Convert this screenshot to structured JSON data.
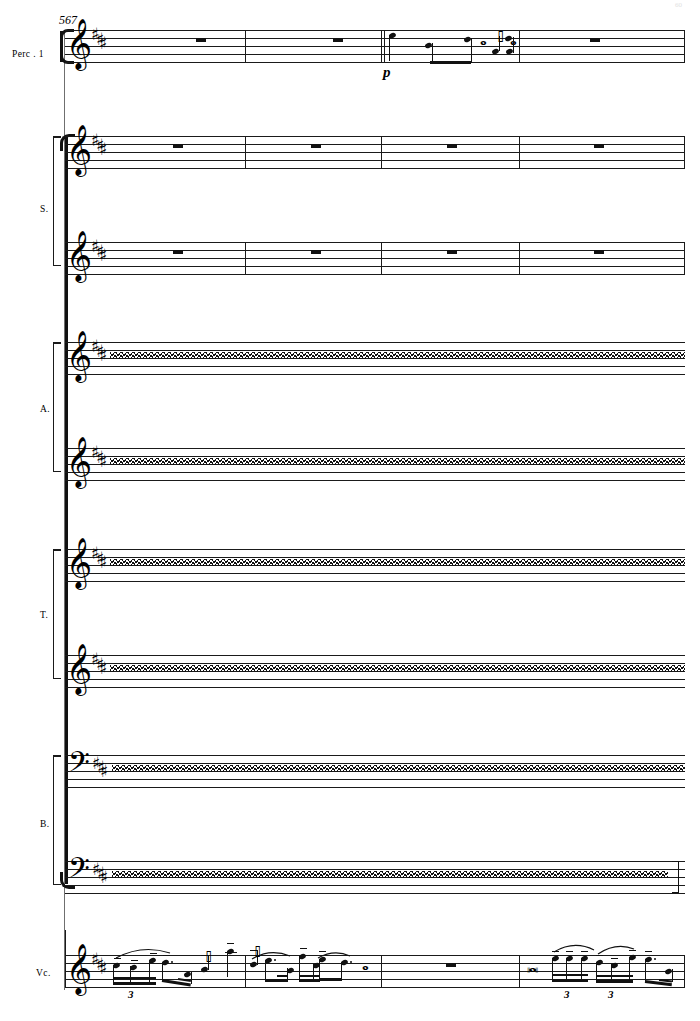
{
  "score": {
    "measure_number": "567",
    "page_number": "60",
    "key_signature": "3 sharps",
    "sharps_count": 3
  },
  "instruments": [
    {
      "id": "perc1",
      "label": "Perc . 1",
      "clef": "treble",
      "staves": 1
    },
    {
      "id": "sop",
      "label": "S.",
      "clef": "treble",
      "staves": 2
    },
    {
      "id": "alto",
      "label": "A.",
      "clef": "treble",
      "staves": 2
    },
    {
      "id": "ten",
      "label": "T.",
      "clef": "treble-8",
      "staves": 2
    },
    {
      "id": "bass",
      "label": "B.",
      "clef": "bass",
      "staves": 2
    },
    {
      "id": "vc",
      "label": "Vc.",
      "clef": "treble",
      "staves": 1
    }
  ],
  "staff_systems": [
    {
      "name": "perc1-staff-1",
      "instrument": "Perc . 1",
      "clef": "treble",
      "content": "rests-and-notes"
    },
    {
      "name": "soprano-staff-1",
      "instrument": "S.",
      "clef": "treble",
      "content": "whole-rests"
    },
    {
      "name": "soprano-staff-2",
      "instrument": "S.",
      "clef": "treble",
      "content": "whole-rests"
    },
    {
      "name": "alto-staff-1",
      "instrument": "A.",
      "clef": "treble",
      "content": "wavy-line"
    },
    {
      "name": "alto-staff-2",
      "instrument": "A.",
      "clef": "treble",
      "content": "wavy-line"
    },
    {
      "name": "tenor-staff-1",
      "instrument": "T.",
      "clef": "treble-8",
      "content": "wavy-line"
    },
    {
      "name": "tenor-staff-2",
      "instrument": "T.",
      "clef": "treble-8",
      "content": "wavy-line"
    },
    {
      "name": "bass-staff-1",
      "instrument": "B.",
      "clef": "bass",
      "content": "wavy-line"
    },
    {
      "name": "bass-staff-2",
      "instrument": "B.",
      "clef": "bass",
      "content": "wavy-line"
    },
    {
      "name": "cello-staff-1",
      "instrument": "Vc.",
      "clef": "treble",
      "content": "melodic-figures"
    }
  ],
  "percussion": {
    "dynamic": "p",
    "measures": [
      {
        "index": 1,
        "rest": "whole"
      },
      {
        "index": 2,
        "rest": "whole"
      },
      {
        "index": 3,
        "rest": null
      },
      {
        "index": 4,
        "rest": "whole"
      }
    ]
  },
  "soprano": {
    "measures": [
      {
        "index": 1,
        "rest": "whole"
      },
      {
        "index": 2,
        "rest": "whole"
      },
      {
        "index": 3,
        "rest": "whole"
      },
      {
        "index": 4,
        "rest": "whole"
      }
    ]
  },
  "cello": {
    "tuplets": [
      "3",
      "3",
      "3"
    ],
    "measures": [
      {
        "index": 1,
        "content": "triplet-and-sixteenths"
      },
      {
        "index": 2,
        "content": "dotted-eighths-and-rest"
      },
      {
        "index": 3,
        "rest": "whole"
      },
      {
        "index": 4,
        "content": "quarter-rest-and-triplets"
      }
    ]
  },
  "symbols": {
    "sharp": "♯",
    "treble_clef": "𝄞",
    "bass_clef": "𝄢",
    "eighth_rest": "𝄽",
    "quarter_rest": "𝄼",
    "octave_below": "8"
  },
  "colors": {
    "ink": "#111111",
    "staff_line": "#1a1a1a",
    "system_line": "#6f6f6f"
  }
}
